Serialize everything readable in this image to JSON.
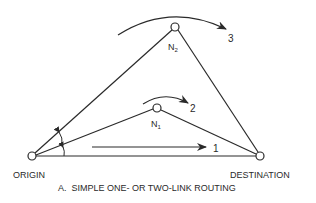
{
  "diagram": {
    "caption": "A.  SIMPLE ONE- OR TWO-LINK ROUTING",
    "nodes": {
      "origin": {
        "label": "ORIGIN"
      },
      "destination": {
        "label": "DESTINATION"
      },
      "n1": {
        "label": "N",
        "sub": "1"
      },
      "n2": {
        "label": "N",
        "sub": "2"
      }
    },
    "routes": [
      {
        "id": "1",
        "label": "1",
        "path": "ORIGIN → DESTINATION (direct)"
      },
      {
        "id": "2",
        "label": "2",
        "path": "ORIGIN → N1 → DESTINATION"
      },
      {
        "id": "3",
        "label": "3",
        "path": "ORIGIN → N2 → DESTINATION"
      }
    ],
    "colors": {
      "line": "#2a2a2a",
      "background": "#ffffff"
    }
  }
}
